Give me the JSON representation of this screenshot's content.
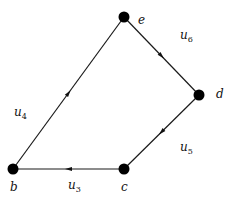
{
  "diagram": {
    "type": "directed-graph",
    "nodes": [
      {
        "id": "e",
        "label": "e"
      },
      {
        "id": "d",
        "label": "d"
      },
      {
        "id": "c",
        "label": "c"
      },
      {
        "id": "b",
        "label": "b"
      }
    ],
    "edges": [
      {
        "id": "u4",
        "from": "b",
        "to": "e",
        "label_base": "u",
        "label_sub": "4"
      },
      {
        "id": "u6",
        "from": "e",
        "to": "d",
        "label_base": "u",
        "label_sub": "6"
      },
      {
        "id": "u5",
        "from": "d",
        "to": "c",
        "label_base": "u",
        "label_sub": "5"
      },
      {
        "id": "u3",
        "from": "c",
        "to": "b",
        "label_base": "u",
        "label_sub": "3"
      }
    ],
    "colors": {
      "node": "#000000",
      "edge": "#1a1a1a",
      "background": "#ffffff"
    }
  }
}
